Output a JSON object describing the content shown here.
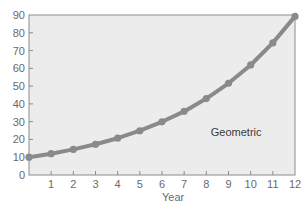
{
  "chart_data": {
    "type": "line",
    "title": "",
    "xlabel": "Year",
    "ylabel": "",
    "x": [
      0,
      1,
      2,
      3,
      4,
      5,
      6,
      7,
      8,
      9,
      10,
      11,
      12
    ],
    "series": [
      {
        "name": "Geometric",
        "values": [
          10,
          12,
          14.4,
          17.3,
          20.7,
          24.9,
          29.9,
          35.8,
          43,
          51.6,
          61.9,
          74.3,
          89.2
        ]
      }
    ],
    "x_tick_labels": [
      "1",
      "2",
      "3",
      "4",
      "5",
      "6",
      "7",
      "8",
      "9",
      "10",
      "11",
      "12"
    ],
    "y_tick_labels": [
      "0",
      "10",
      "20",
      "30",
      "40",
      "50",
      "60",
      "70",
      "80",
      "90"
    ],
    "xlim": [
      0,
      12
    ],
    "ylim": [
      0,
      90
    ],
    "grid": false,
    "legend": "none",
    "annotations": [
      {
        "text": "Geometric",
        "x": 8.2,
        "y": 22
      }
    ]
  },
  "colors": {
    "plot_background": "#ececec",
    "frame": "#8c8c8c",
    "line": "#8a8a8a",
    "marker": "#8a8a8a",
    "text": "#6a6a6a"
  }
}
